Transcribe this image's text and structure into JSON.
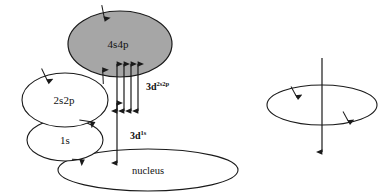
{
  "figure": {
    "background_color": "#ffffff",
    "stroke_color": "#1a1a1a",
    "shaded_fill": "#a6a6a6",
    "unshaded_fill": "#ffffff",
    "width": 389,
    "height": 193
  },
  "left_diagram": {
    "name": "shell-transition-diagram",
    "shells": [
      {
        "id": "shell-4s4p",
        "label": "4s4p",
        "shaded": true,
        "fill": "#a6a6a6",
        "cx": 120,
        "cy": 44,
        "rx": 52,
        "ry": 33
      },
      {
        "id": "shell-2s2p",
        "label": "2s2p",
        "shaded": false,
        "fill": "#ffffff",
        "cx": 65,
        "cy": 100,
        "rx": 43,
        "ry": 27
      },
      {
        "id": "shell-1s",
        "label": "1s",
        "shaded": false,
        "fill": "#ffffff",
        "cx": 65,
        "cy": 140,
        "rx": 38,
        "ry": 21
      },
      {
        "id": "shell-nucleus",
        "label": "nucleus",
        "shaded": false,
        "fill": "#ffffff",
        "cx": 148,
        "cy": 170,
        "rx": 90,
        "ry": 21
      }
    ],
    "transitions": [
      {
        "id": "transition-3d-2s2p",
        "label_base": "3d",
        "label_sup": "2s2p",
        "arrow_count": 4,
        "label_x": 146,
        "label_y": 90
      },
      {
        "id": "transition-3d-1s",
        "label_base": "3d",
        "label_sup": "1s",
        "arrow_count": 1,
        "label_x": 130,
        "label_y": 139
      }
    ]
  },
  "right_diagram": {
    "name": "orbital-spin-diagram",
    "orbit": {
      "id": "orbit-ellipse",
      "cx": 322,
      "cy": 105,
      "rx": 55,
      "ry": 20
    },
    "axis": {
      "id": "spin-axis-arrow",
      "x": 322,
      "y_top": 58,
      "y_bottom": 152,
      "direction": "down"
    },
    "orbit_direction_markers": 2
  }
}
